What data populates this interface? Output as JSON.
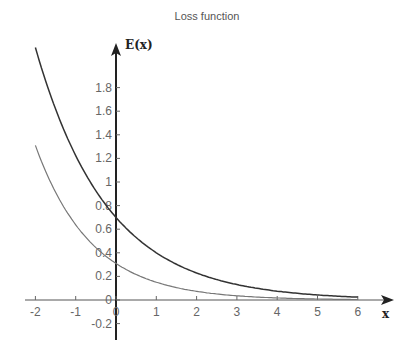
{
  "chart_data": {
    "type": "line",
    "title": "Loss function",
    "xlabel": "x",
    "ylabel": "E(x)",
    "xlim": [
      -2,
      6
    ],
    "ylim": [
      -0.2,
      2.0
    ],
    "x_ticks": [
      "-2",
      "-1",
      "0",
      "1",
      "2",
      "3",
      "4",
      "5",
      "6"
    ],
    "y_ticks": [
      "-0.2",
      "0",
      "0.2",
      "0.4",
      "0.6",
      "0.8",
      "1",
      "1.2",
      "1.4",
      "1.6",
      "1.8"
    ],
    "grid": false,
    "legend": null,
    "series": [
      {
        "name": "upper curve",
        "color": "#333333",
        "x": [
          -2,
          -1.5,
          -1,
          -0.5,
          0,
          0.5,
          1,
          1.5,
          2,
          2.5,
          3,
          3.5,
          4,
          4.5,
          5,
          5.5,
          6
        ],
        "y": [
          2.14,
          1.62,
          1.22,
          0.92,
          0.7,
          0.53,
          0.4,
          0.3,
          0.23,
          0.17,
          0.13,
          0.1,
          0.07,
          0.06,
          0.04,
          0.03,
          0.02
        ]
      },
      {
        "name": "lower curve",
        "color": "#777777",
        "x": [
          -2,
          -1.5,
          -1,
          -0.5,
          0,
          0.5,
          1,
          1.5,
          2,
          2.5,
          3,
          3.5,
          4,
          4.5,
          5,
          5.5,
          6
        ],
        "y": [
          1.31,
          0.91,
          0.64,
          0.44,
          0.31,
          0.22,
          0.15,
          0.1,
          0.07,
          0.05,
          0.04,
          0.02,
          0.02,
          0.01,
          0.01,
          0.01,
          0.0
        ]
      }
    ]
  }
}
